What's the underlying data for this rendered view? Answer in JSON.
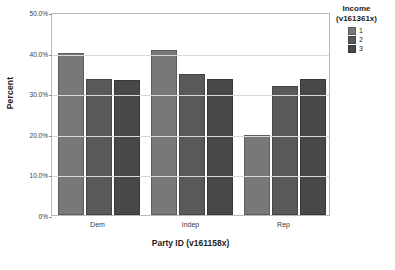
{
  "chart_data": {
    "type": "bar",
    "title": "",
    "xlabel": "Party  ID (v161158x)",
    "ylabel": "Percent",
    "categories": [
      "Dem",
      "Indep",
      "Rep"
    ],
    "series": [
      {
        "name": "1",
        "values": [
          39.9,
          40.7,
          19.8
        ],
        "color": "#787878"
      },
      {
        "name": "2",
        "values": [
          33.6,
          34.7,
          31.7
        ],
        "color": "#595959"
      },
      {
        "name": "3",
        "values": [
          33.2,
          33.4,
          33.4
        ],
        "color": "#484848"
      }
    ],
    "ylim": [
      0,
      50
    ],
    "ytick_labels": [
      "0%",
      "10.0%",
      "20.0%",
      "30.0%",
      "40.0%",
      "50.0%"
    ],
    "ytick_values": [
      0,
      10,
      20,
      30,
      40,
      50
    ],
    "grid": true,
    "legend_position": "right",
    "legend_title": "Income",
    "legend_subtitle": "(v161361x)"
  }
}
